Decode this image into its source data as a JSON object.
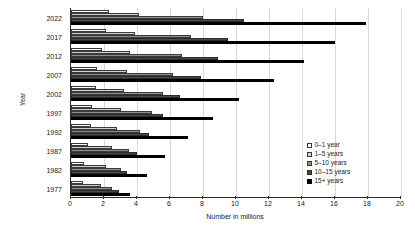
{
  "chart_data": {
    "type": "bar",
    "orientation": "horizontal",
    "title": "",
    "xlabel": "Number in millions",
    "ylabel": "Year",
    "xlim": [
      0,
      20
    ],
    "xticks": [
      0,
      2,
      4,
      6,
      8,
      10,
      12,
      14,
      16,
      18,
      20
    ],
    "grid": true,
    "legend_position": "right",
    "categories": [
      "2022",
      "2017",
      "2012",
      "2007",
      "2002",
      "1997",
      "1992",
      "1987",
      "1982",
      "1977"
    ],
    "series": [
      {
        "name": "0–1 year",
        "values": [
          2.3,
          2.1,
          1.9,
          1.6,
          1.5,
          1.3,
          1.2,
          1.0,
          0.8,
          0.7
        ]
      },
      {
        "name": "1–5 years",
        "values": [
          4.1,
          3.9,
          3.6,
          3.4,
          3.2,
          3.0,
          2.8,
          2.5,
          2.1,
          1.8
        ]
      },
      {
        "name": "5–10 years",
        "values": [
          8.0,
          7.3,
          6.7,
          6.2,
          5.6,
          4.9,
          4.2,
          3.5,
          3.0,
          2.5
        ]
      },
      {
        "name": "10–15 years",
        "values": [
          10.5,
          9.5,
          8.9,
          7.9,
          6.6,
          5.6,
          4.7,
          4.0,
          3.4,
          2.9
        ]
      },
      {
        "name": "15+ years",
        "values": [
          17.9,
          16.0,
          14.1,
          12.3,
          10.2,
          8.6,
          7.1,
          5.7,
          4.6,
          3.6
        ]
      }
    ]
  },
  "legend": {
    "items": [
      {
        "label": "0–1 year"
      },
      {
        "label": "1–5 years"
      },
      {
        "label": "5–10 years"
      },
      {
        "label": "10–15 years"
      },
      {
        "label": "15+ years"
      }
    ]
  }
}
